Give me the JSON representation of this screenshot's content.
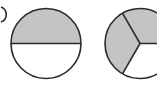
{
  "figure": {
    "colors": {
      "shade": "#c4c4c4",
      "stroke": "#2b2b2b",
      "background": "#ffffff"
    },
    "circles": [
      {
        "id": "halves",
        "parts": 2,
        "shaded": 1,
        "fraction": "1/2",
        "cx": 46,
        "cy": 43.5,
        "r": 35
      },
      {
        "id": "thirds",
        "parts": 3,
        "shaded": 2,
        "fraction": "2/3",
        "cx": 140,
        "cy": 43.5,
        "r": 35
      }
    ]
  }
}
